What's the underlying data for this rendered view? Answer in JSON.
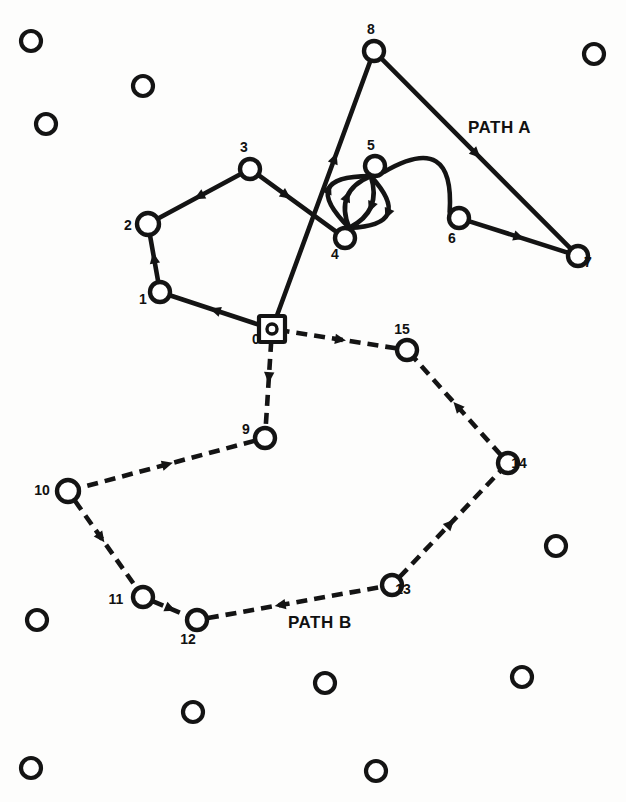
{
  "figure": {
    "background_color": "#fdfdfc",
    "ink_color": "#141414",
    "width": 626,
    "height": 802
  },
  "labels": {
    "path_a": "PATH A",
    "path_b": "PATH B"
  },
  "path_label_positions": {
    "path_a": {
      "x": 468,
      "y": 133
    },
    "path_b": {
      "x": 288,
      "y": 628
    }
  },
  "nodes": [
    {
      "id": "0",
      "label": "0",
      "x": 272,
      "y": 329,
      "shape": "square-root",
      "r": 11,
      "label_x": 256,
      "label_y": 344,
      "style": "solid"
    },
    {
      "id": "1",
      "label": "1",
      "x": 160,
      "y": 292,
      "shape": "circle",
      "r": 10,
      "label_x": 143,
      "label_y": 304,
      "style": "solid"
    },
    {
      "id": "2",
      "label": "2",
      "x": 148,
      "y": 224,
      "shape": "circle",
      "r": 11,
      "label_x": 128,
      "label_y": 230,
      "style": "solid"
    },
    {
      "id": "3",
      "label": "3",
      "x": 250,
      "y": 169,
      "shape": "circle",
      "r": 10,
      "label_x": 244,
      "label_y": 152,
      "style": "solid"
    },
    {
      "id": "4",
      "label": "4",
      "x": 345,
      "y": 238,
      "shape": "circle",
      "r": 10,
      "label_x": 335,
      "label_y": 259,
      "style": "solid"
    },
    {
      "id": "5",
      "label": "5",
      "x": 375,
      "y": 166,
      "shape": "circle",
      "r": 10,
      "label_x": 371,
      "label_y": 150,
      "style": "solid"
    },
    {
      "id": "6",
      "label": "6",
      "x": 459,
      "y": 218,
      "shape": "circle",
      "r": 10,
      "label_x": 452,
      "label_y": 243,
      "style": "solid"
    },
    {
      "id": "7",
      "label": "7",
      "x": 578,
      "y": 256,
      "shape": "circle",
      "r": 10,
      "label_x": 588,
      "label_y": 267,
      "style": "solid"
    },
    {
      "id": "8",
      "label": "8",
      "x": 374,
      "y": 51,
      "shape": "circle",
      "r": 10,
      "label_x": 371,
      "label_y": 34,
      "style": "solid"
    },
    {
      "id": "9",
      "label": "9",
      "x": 265,
      "y": 438,
      "shape": "circle",
      "r": 10,
      "label_x": 246,
      "label_y": 434,
      "style": "dashed"
    },
    {
      "id": "10",
      "label": "10",
      "x": 68,
      "y": 491,
      "shape": "circle",
      "r": 11,
      "label_x": 42,
      "label_y": 495,
      "style": "dashed"
    },
    {
      "id": "11",
      "label": "11",
      "x": 143,
      "y": 597,
      "shape": "circle",
      "r": 10,
      "label_x": 116,
      "label_y": 604,
      "style": "dashed"
    },
    {
      "id": "12",
      "label": "12",
      "x": 197,
      "y": 620,
      "shape": "circle",
      "r": 10,
      "label_x": 188,
      "label_y": 644,
      "style": "dashed"
    },
    {
      "id": "13",
      "label": "13",
      "x": 392,
      "y": 585,
      "shape": "circle",
      "r": 10,
      "label_x": 403,
      "label_y": 594,
      "style": "dashed"
    },
    {
      "id": "14",
      "label": "14",
      "x": 508,
      "y": 463,
      "shape": "circle",
      "r": 10,
      "label_x": 519,
      "label_y": 468,
      "style": "dashed"
    },
    {
      "id": "15",
      "label": "15",
      "x": 407,
      "y": 350,
      "shape": "circle",
      "r": 10,
      "label_x": 402,
      "label_y": 334,
      "style": "dashed"
    }
  ],
  "edges": [
    {
      "id": "e-0-1",
      "from": "0",
      "to": "1",
      "style": "solid",
      "kind": "line",
      "arrow_t": 0.5,
      "arrow_dir": "forward",
      "path_group": "A"
    },
    {
      "id": "e-1-2",
      "from": "1",
      "to": "2",
      "style": "solid",
      "kind": "line",
      "arrow_t": 0.5,
      "arrow_dir": "forward",
      "path_group": "A"
    },
    {
      "id": "e-2-3",
      "from": "2",
      "to": "3",
      "style": "solid",
      "kind": "line",
      "arrow_t": 0.5,
      "arrow_dir": "backward",
      "path_group": "A"
    },
    {
      "id": "e-3-4",
      "from": "3",
      "to": "4",
      "style": "solid",
      "kind": "line",
      "arrow_t": 0.35,
      "arrow_dir": "forward",
      "path_group": "A"
    },
    {
      "id": "e-4-5a",
      "from": "4",
      "to": "5",
      "style": "solid",
      "kind": "curve",
      "bow": 30,
      "arrow_t": 0.5,
      "arrow_dir": "backward",
      "path_group": "A"
    },
    {
      "id": "e-4-5b",
      "from": "4",
      "to": "5",
      "style": "solid",
      "kind": "curve",
      "bow": 12,
      "arrow_t": 0.5,
      "arrow_dir": "backward",
      "path_group": "A"
    },
    {
      "id": "e-4-5c",
      "from": "4",
      "to": "5",
      "style": "solid",
      "kind": "curve",
      "bow": -14,
      "arrow_t": 0.5,
      "arrow_dir": "forward",
      "path_group": "A"
    },
    {
      "id": "e-4-5d",
      "from": "4",
      "to": "5",
      "style": "solid",
      "kind": "curve",
      "bow": -34,
      "arrow_t": 0.5,
      "arrow_dir": "forward",
      "path_group": "A"
    },
    {
      "id": "e-5-6",
      "from": "5",
      "to": "6",
      "style": "solid",
      "kind": "curve",
      "bow": -36,
      "arrow_t": 0.5,
      "arrow_dir": "none",
      "path_group": "A"
    },
    {
      "id": "e-6-7",
      "from": "6",
      "to": "7",
      "style": "solid",
      "kind": "line",
      "arrow_t": 0.5,
      "arrow_dir": "forward",
      "path_group": "A"
    },
    {
      "id": "e-7-8",
      "from": "7",
      "to": "8",
      "style": "solid",
      "kind": "line",
      "arrow_t": 0.5,
      "arrow_dir": "backward",
      "path_group": "A"
    },
    {
      "id": "e-8-0",
      "from": "8",
      "to": "0",
      "style": "solid",
      "kind": "line",
      "arrow_t": 0.38,
      "arrow_dir": "backward",
      "path_group": "A"
    },
    {
      "id": "e-0-9",
      "from": "0",
      "to": "9",
      "style": "dashed",
      "kind": "line",
      "arrow_t": 0.42,
      "arrow_dir": "forward",
      "path_group": "B"
    },
    {
      "id": "e-9-10",
      "from": "9",
      "to": "10",
      "style": "dashed",
      "kind": "line",
      "arrow_t": 0.5,
      "arrow_dir": "backward",
      "path_group": "B"
    },
    {
      "id": "e-10-11",
      "from": "10",
      "to": "11",
      "style": "dashed",
      "kind": "line",
      "arrow_t": 0.42,
      "arrow_dir": "forward",
      "path_group": "B"
    },
    {
      "id": "e-11-12",
      "from": "11",
      "to": "12",
      "style": "dashed",
      "kind": "line",
      "arrow_t": 0.5,
      "arrow_dir": "forward",
      "path_group": "B"
    },
    {
      "id": "e-12-13",
      "from": "12",
      "to": "13",
      "style": "dashed",
      "kind": "line",
      "arrow_t": 0.42,
      "arrow_dir": "backward",
      "path_group": "B"
    },
    {
      "id": "e-13-14",
      "from": "13",
      "to": "14",
      "style": "dashed",
      "kind": "line",
      "arrow_t": 0.5,
      "arrow_dir": "forward",
      "path_group": "B"
    },
    {
      "id": "e-14-15",
      "from": "14",
      "to": "15",
      "style": "dashed",
      "kind": "line",
      "arrow_t": 0.5,
      "arrow_dir": "forward",
      "path_group": "B"
    },
    {
      "id": "e-15-0",
      "from": "15",
      "to": "0",
      "style": "dashed",
      "kind": "line",
      "arrow_t": 0.5,
      "arrow_dir": "backward",
      "path_group": "B"
    }
  ],
  "background_circles": [
    {
      "x": 31,
      "y": 41,
      "r": 10
    },
    {
      "x": 143,
      "y": 86,
      "r": 10
    },
    {
      "x": 46,
      "y": 124,
      "r": 10
    },
    {
      "x": 594,
      "y": 54,
      "r": 10
    },
    {
      "x": 556,
      "y": 546,
      "r": 10
    },
    {
      "x": 37,
      "y": 620,
      "r": 10
    },
    {
      "x": 522,
      "y": 677,
      "r": 10
    },
    {
      "x": 325,
      "y": 683,
      "r": 10
    },
    {
      "x": 193,
      "y": 712,
      "r": 10
    },
    {
      "x": 31,
      "y": 768,
      "r": 10
    },
    {
      "x": 376,
      "y": 771,
      "r": 10
    }
  ]
}
